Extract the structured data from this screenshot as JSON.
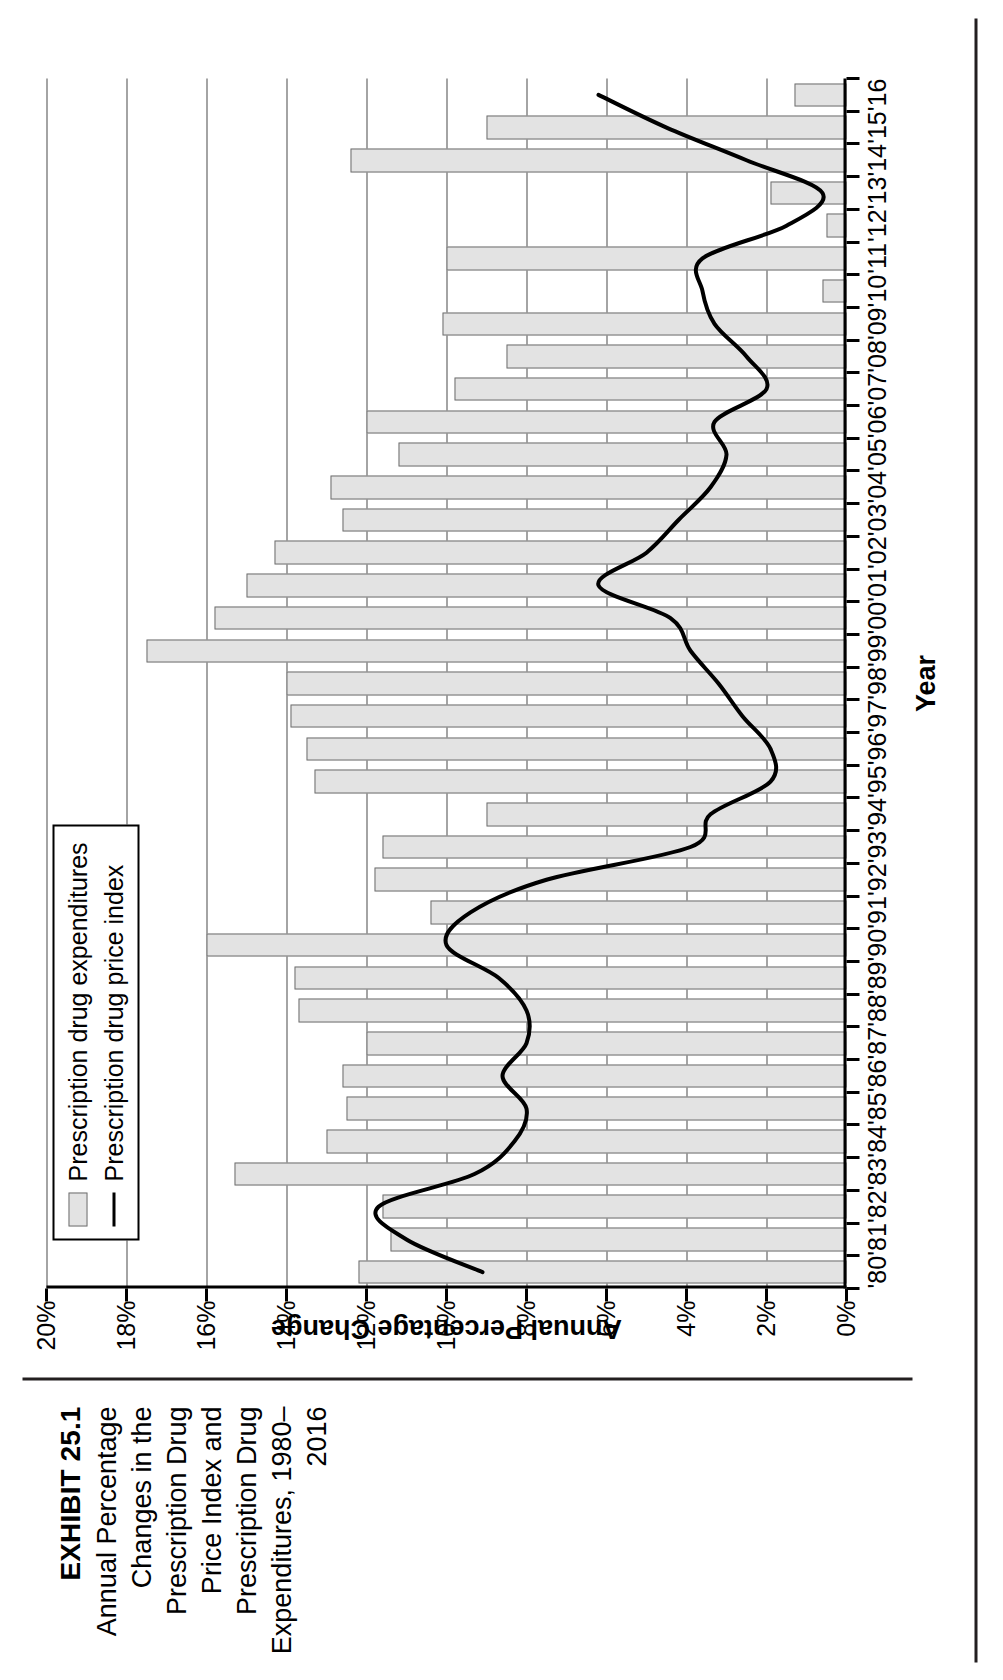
{
  "exhibit": {
    "number": "EXHIBIT 25.1",
    "title": "Annual Percentage Changes in the Prescription Drug Price Index and Prescription Drug Expenditures, 1980–2016"
  },
  "legend": {
    "position": "top-left",
    "items": [
      {
        "label": "Prescription drug expenditures",
        "marker": "bar-swatch",
        "color": "#e3e3e3"
      },
      {
        "label": "Prescription drug price index",
        "marker": "line-swatch",
        "color": "#000000"
      }
    ]
  },
  "axes": {
    "x_label": "Year",
    "y_label": "Annual Percentage Change",
    "y_ticks": [
      "0%",
      "2%",
      "4%",
      "6%",
      "8%",
      "10%",
      "12%",
      "14%",
      "16%",
      "18%",
      "20%"
    ],
    "y_tick_values": [
      0,
      2,
      4,
      6,
      8,
      10,
      12,
      14,
      16,
      18,
      20
    ],
    "y_min": 0,
    "y_max": 20,
    "grid": "horizontal"
  },
  "chart_data": {
    "type": "bar",
    "title": "Annual Percentage Changes in the Prescription Drug Price Index and Prescription Drug Expenditures, 1980–2016",
    "xlabel": "Year",
    "ylabel": "Annual Percentage Change",
    "ylim": [
      0,
      20
    ],
    "grid": true,
    "legend_position": "top-left",
    "categories": [
      "'80",
      "'81",
      "'82",
      "'83",
      "'84",
      "'85",
      "'86",
      "'87",
      "'88",
      "'89",
      "'90",
      "'91",
      "'92",
      "'93",
      "'94",
      "'95",
      "'96",
      "'97",
      "'98",
      "'99",
      "'00",
      "'01",
      "'02",
      "'03",
      "'04",
      "'05",
      "'06",
      "'07",
      "'08",
      "'09",
      "'10",
      "'11",
      "'12",
      "'13",
      "'14",
      "'15",
      "'16"
    ],
    "series": [
      {
        "name": "Prescription drug expenditures",
        "type": "bar",
        "color": "#e3e3e3",
        "values": [
          12.2,
          11.4,
          11.6,
          15.3,
          13.0,
          12.5,
          12.6,
          12.0,
          13.7,
          13.8,
          16.0,
          10.4,
          11.8,
          11.6,
          9.0,
          13.3,
          13.5,
          13.9,
          14.0,
          17.5,
          15.8,
          15.0,
          14.3,
          12.6,
          12.9,
          11.2,
          12.0,
          9.8,
          8.5,
          10.1,
          0.6,
          10.0,
          0.5,
          1.9,
          12.4,
          9.0,
          1.3
        ]
      },
      {
        "name": "Prescription drug price index",
        "type": "line",
        "color": "#000000",
        "values": [
          9.1,
          11.0,
          11.7,
          9.3,
          8.3,
          8.0,
          8.6,
          8.0,
          8.0,
          8.7,
          10.0,
          9.4,
          7.5,
          3.9,
          3.4,
          1.9,
          1.9,
          2.6,
          3.2,
          3.9,
          4.4,
          6.2,
          5.0,
          4.2,
          3.4,
          3.0,
          3.3,
          2.0,
          2.5,
          3.3,
          3.6,
          3.6,
          1.5,
          0.6,
          2.5,
          4.5,
          6.2
        ]
      }
    ]
  }
}
